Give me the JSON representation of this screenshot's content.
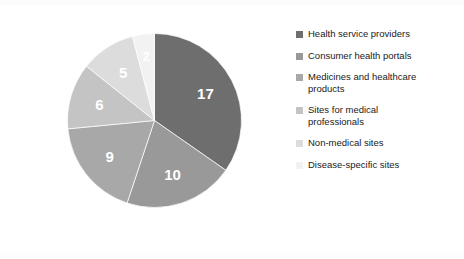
{
  "chart_data": {
    "type": "pie",
    "title": "",
    "subtitle": "",
    "xlabel": "",
    "ylabel": "",
    "grid": false,
    "legend_position": "right",
    "start_angle_deg": 0,
    "direction": "clockwise",
    "total": 49,
    "categories": [
      "Health service providers",
      "Consumer health portals",
      "Medicines and healthcare products",
      "Sites for medical professionals",
      "Non-medical sites",
      "Disease-specific sites"
    ],
    "values": [
      17,
      10,
      9,
      6,
      5,
      2
    ],
    "data_labels": [
      "17",
      "10",
      "9",
      "6",
      "5",
      "2"
    ],
    "colors": [
      "#6e6e6e",
      "#999999",
      "#a8a8a8",
      "#c4c4c4",
      "#dcdcdc",
      "#f2f2f2"
    ],
    "slices": [
      {
        "label": "Health service providers",
        "value": 17,
        "data_label": "17",
        "color": "#6e6e6e"
      },
      {
        "label": "Consumer health portals",
        "value": 10,
        "data_label": "10",
        "color": "#999999"
      },
      {
        "label": "Medicines and healthcare products",
        "value": 9,
        "data_label": "9",
        "color": "#a8a8a8"
      },
      {
        "label": "Sites for medical professionals",
        "value": 6,
        "data_label": "6",
        "color": "#c4c4c4"
      },
      {
        "label": "Non-medical sites",
        "value": 5,
        "data_label": "5",
        "color": "#dcdcdc"
      },
      {
        "label": "Disease-specific sites",
        "value": 2,
        "data_label": "2",
        "color": "#f2f2f2"
      }
    ]
  },
  "legend": {
    "items": [
      {
        "label": "Health service providers",
        "color": "#6e6e6e"
      },
      {
        "label": "Consumer health portals",
        "color": "#999999"
      },
      {
        "label": "Medicines and healthcare\nproducts",
        "color": "#a8a8a8"
      },
      {
        "label": "Sites for medical\nprofessionals",
        "color": "#c4c4c4"
      },
      {
        "label": "Non-medical sites",
        "color": "#dcdcdc"
      },
      {
        "label": "Disease-specific sites",
        "color": "#f2f2f2"
      }
    ]
  },
  "caption": {
    "fragment": ""
  }
}
